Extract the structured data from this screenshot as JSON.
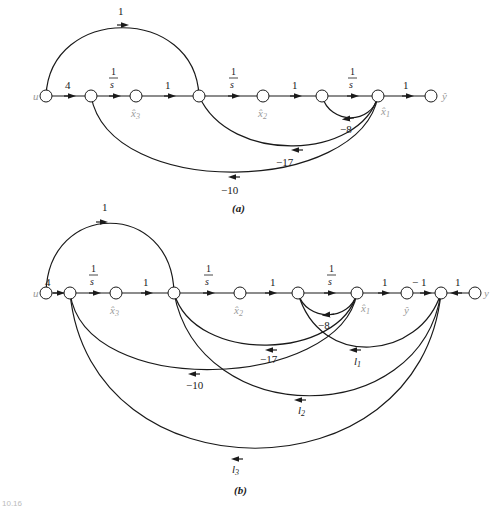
{
  "panel_a": {
    "caption": "(a)",
    "nodes": {
      "u": "u",
      "x3": "x̂",
      "x3_sub": "3",
      "x2": "x̂",
      "x2_sub": "2",
      "x1": "x̂",
      "x1_sub": "1",
      "yhat": "ŷ"
    },
    "gains": {
      "feedforward": "1",
      "input": "4",
      "int1_num": "1",
      "int1_den": "s",
      "b1": "1",
      "int2_num": "1",
      "int2_den": "s",
      "b2": "1",
      "int3_num": "1",
      "int3_den": "s",
      "out": "1",
      "fb8": "−8",
      "fb17": "−17",
      "fb10": "−10"
    }
  },
  "panel_b": {
    "caption": "(b)",
    "nodes": {
      "u": "u",
      "x3": "x̂",
      "x3_sub": "3",
      "x2": "x̂",
      "x2_sub": "2",
      "x1": "x̂",
      "x1_sub": "1",
      "yhat": "ŷ",
      "y": "y"
    },
    "gains": {
      "feedforward": "1",
      "input": "4",
      "int1_num": "1",
      "int1_den": "s",
      "b1": "1",
      "int2_num": "1",
      "int2_den": "s",
      "b2": "1",
      "int3_num": "1",
      "int3_den": "s",
      "out": "1",
      "neg1": "− 1",
      "yin": "1",
      "fb8": "−8",
      "fb17": "−17",
      "fb10": "−10",
      "l1": "l",
      "l1_sub": "1",
      "l2": "l",
      "l2_sub": "2",
      "l3": "l",
      "l3_sub": "3"
    }
  },
  "footer": {
    "figure_number": "10.16"
  }
}
